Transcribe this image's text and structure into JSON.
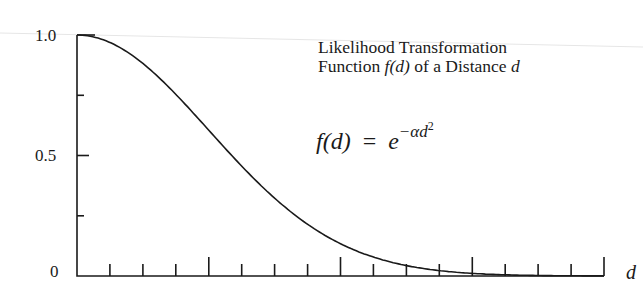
{
  "chart_data": {
    "type": "line",
    "title": "Likelihood Transformation Function f(d) of a Distance d",
    "title_lines": [
      "Likelihood Transformation",
      "Function",
      "f(d)",
      "of a Distance",
      "d"
    ],
    "formula": {
      "lhs": "f(d)",
      "eq": "=",
      "base": "e",
      "exponent": "−αd",
      "power": "2"
    },
    "xlabel": "d",
    "ylabel": "",
    "yticks": [
      "0",
      "0.5",
      "1.0"
    ],
    "ylim": [
      0,
      1.0
    ],
    "x_minor_ticks": 16,
    "x_major_every": 4,
    "y_minor_ticks": 4,
    "xlim": [
      0,
      16
    ],
    "alpha": 0.0314,
    "x": [
      0,
      1,
      2,
      3,
      4,
      5,
      6,
      7,
      8,
      9,
      10,
      11,
      12,
      13,
      14,
      15,
      16
    ],
    "values": [
      1.0,
      0.97,
      0.88,
      0.75,
      0.6,
      0.46,
      0.32,
      0.21,
      0.13,
      0.08,
      0.04,
      0.02,
      0.01,
      0.005,
      0.002,
      0.001,
      0.0
    ],
    "grid": false,
    "legend": "none"
  },
  "colors": {
    "ink": "#1a1a1a",
    "background": "#ffffff"
  }
}
